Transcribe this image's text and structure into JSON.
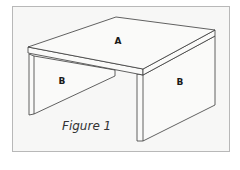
{
  "figure": {
    "caption": "Figure 1",
    "labels": {
      "top": "A",
      "left_side": "B",
      "right_side": "B"
    },
    "colors": {
      "background": "#f7f7f6",
      "frame": "#b8b8b8",
      "line": "#3a3a3a",
      "surface": "#f9f9f8"
    }
  }
}
